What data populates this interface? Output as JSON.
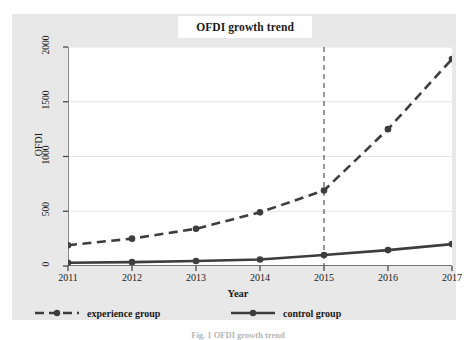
{
  "chart_data": {
    "type": "line",
    "title": "OFDI growth trend",
    "xlabel": "Year",
    "ylabel": "OFDI",
    "x": [
      2011,
      2012,
      2013,
      2014,
      2015,
      2016,
      2017
    ],
    "categories": [
      "2011",
      "2012",
      "2013",
      "2014",
      "2015",
      "2016",
      "2017"
    ],
    "xlim": [
      2011,
      2017
    ],
    "ylim": [
      0,
      2000
    ],
    "yticks": [
      0,
      500,
      1000,
      1500,
      2000
    ],
    "ytick_labels": [
      "0",
      "500",
      "1000",
      "1500",
      "2000"
    ],
    "grid": "horizontal",
    "legend_position": "bottom",
    "series": [
      {
        "name": "experience group",
        "style": "dashed",
        "marker": "circle",
        "color": "#3d3d3d",
        "values": [
          190,
          250,
          340,
          490,
          690,
          1250,
          1890
        ]
      },
      {
        "name": "control group",
        "style": "solid",
        "marker": "circle",
        "color": "#3d3d3d",
        "values": [
          30,
          35,
          45,
          60,
          100,
          145,
          200
        ]
      }
    ],
    "annotations": [
      {
        "type": "vertical-reference-line",
        "name": "policy-year-line",
        "x": 2015,
        "style": "dashed",
        "color": "#6e6e6e"
      }
    ]
  },
  "legend": {
    "entries": [
      {
        "label": "experience group",
        "style": "dashed"
      },
      {
        "label": "control group",
        "style": "solid"
      }
    ]
  },
  "caption": {
    "text": "Fig. 1  OFDI growth trend"
  },
  "colors": {
    "panel": "#e8e8e8",
    "plot_background": "#ffffff",
    "line": "#3d3d3d",
    "gridline": "#e4e4e4",
    "axis": "#4a4a4a",
    "text": "#1a1a1a"
  }
}
